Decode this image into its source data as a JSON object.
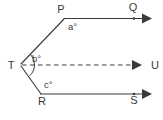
{
  "figure": {
    "background_color": "#ffffff",
    "stroke_color": "#3a3a3a",
    "label_color": "#3a3a3a"
  },
  "points": {
    "T": {
      "label": "T",
      "x": 20,
      "y": 65
    },
    "P": {
      "label": "P",
      "x": 64,
      "y": 18
    },
    "R": {
      "label": "R",
      "x": 41,
      "y": 95
    },
    "Q": {
      "label": "Q",
      "x": 134,
      "y": 18
    },
    "U": {
      "label": "U",
      "x": 150,
      "y": 65
    },
    "S": {
      "label": "S",
      "x": 134,
      "y": 94
    }
  },
  "angles": {
    "a": {
      "label": "a°",
      "at_vertex": "P"
    },
    "b": {
      "label": "b°",
      "at_vertex": "T"
    },
    "c": {
      "label": "c°",
      "at_vertex": "R"
    }
  },
  "segments": [
    {
      "name": "T-to-P",
      "style": "solid",
      "from": "T",
      "to": "P"
    },
    {
      "name": "T-to-R",
      "style": "solid",
      "from": "T",
      "to": "R"
    },
    {
      "name": "P-to-Q-ray",
      "style": "solid",
      "from": "P",
      "to": "Q",
      "arrow": true
    },
    {
      "name": "T-to-U-ray",
      "style": "dashed",
      "from": "T",
      "to": "U",
      "arrow": true
    },
    {
      "name": "R-to-S-ray",
      "style": "solid",
      "from": "R",
      "to": "S",
      "arrow": true
    }
  ]
}
